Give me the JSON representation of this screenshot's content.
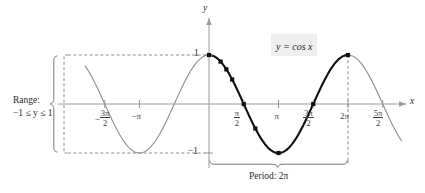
{
  "figure": {
    "kind": "math-graph",
    "equation_label": "y = cos x",
    "axis_labels": {
      "x": "x",
      "y": "y"
    },
    "y_ticks": [
      {
        "value": 1,
        "label": "1"
      },
      {
        "value": -1,
        "label": "−1"
      }
    ],
    "x_ticks": [
      {
        "value": -4.71238898038469,
        "num": "3π",
        "den": "2",
        "sign": "−",
        "type": "fraction"
      },
      {
        "value": -3.141592653589793,
        "label": "−π",
        "type": "plain"
      },
      {
        "value": 1.570796326794897,
        "num": "π",
        "den": "2",
        "sign": "",
        "type": "fraction"
      },
      {
        "value": 3.141592653589793,
        "label": "π",
        "type": "plain"
      },
      {
        "value": 4.71238898038469,
        "num": "3π",
        "den": "2",
        "sign": "",
        "type": "fraction"
      },
      {
        "value": 6.283185307179586,
        "label": "2π",
        "type": "plain"
      },
      {
        "value": 7.853981633974483,
        "num": "5π",
        "den": "2",
        "sign": "",
        "type": "fraction"
      }
    ],
    "annotations": {
      "range_line1": "Range:",
      "range_line2": "−1 ≤ y ≤ 1",
      "period": "Period: 2π"
    },
    "colors": {
      "curve_highlight": "#111111",
      "curve_faint": "#8c8c8c",
      "axis": "#9a9a9a",
      "dashed": "#7f7f7f",
      "brace": "#6e6e6e",
      "text": "#2b2b2b",
      "equation_background": "#efefef"
    }
  },
  "chart_data": {
    "type": "line",
    "title": "",
    "subtitle": "",
    "xlabel": "x",
    "ylabel": "y",
    "function": "y = cos x",
    "xlim": [
      -5.6,
      8.7
    ],
    "ylim": [
      -1.45,
      1.45
    ],
    "grid": false,
    "legend": "none",
    "series": [
      {
        "name": "y = cos x (full domain, light gray)",
        "style": "thin-gray",
        "x_domain": [
          -5.6,
          8.7
        ]
      },
      {
        "name": "y = cos x (one period highlighted, bold black)",
        "style": "thick-black",
        "x_domain": [
          0,
          6.283185307179586
        ]
      }
    ],
    "marked_points": [
      {
        "x": 0.0,
        "x_label": "0",
        "y": 1.0
      },
      {
        "x": 0.5235987755982988,
        "x_label": "π/6",
        "y": 0.866
      },
      {
        "x": 0.7853981633974483,
        "x_label": "π/4",
        "y": 0.7071
      },
      {
        "x": 1.0471975511965976,
        "x_label": "π/3",
        "y": 0.5
      },
      {
        "x": 1.5707963267948966,
        "x_label": "π/2",
        "y": 0.0
      },
      {
        "x": 2.0943951023931953,
        "x_label": "2π/3",
        "y": -0.5
      },
      {
        "x": 3.141592653589793,
        "x_label": "π",
        "y": -1.0
      },
      {
        "x": 4.71238898038469,
        "x_label": "3π/2",
        "y": 0.0
      },
      {
        "x": 6.283185307179586,
        "x_label": "2π",
        "y": 1.0
      }
    ],
    "annotations": [
      {
        "text": "y = cos x",
        "x": 3.9,
        "y": 1.18,
        "kind": "equation-callout"
      },
      {
        "text": "Range: −1 ≤ y ≤ 1",
        "kind": "range-brace",
        "y_from": -1,
        "y_to": 1
      },
      {
        "text": "Period: 2π",
        "kind": "period-brace",
        "x_from": 0,
        "x_to": 6.283185307179586
      }
    ],
    "reference_lines": [
      {
        "kind": "dashed-horizontal",
        "y": 1
      },
      {
        "kind": "dashed-horizontal",
        "y": -1
      },
      {
        "kind": "dashed-vertical",
        "x": 6.283185307179586
      }
    ]
  }
}
